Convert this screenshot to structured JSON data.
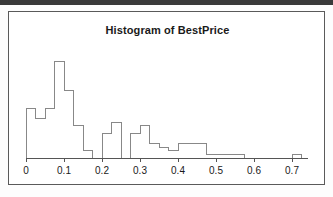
{
  "figure": {
    "title": "Histogram of BestPrice",
    "frame": {
      "stroke": "#5a5a5a",
      "background": "#ffffff"
    }
  },
  "chart_data": {
    "type": "bar",
    "title": "Histogram of BestPrice",
    "xlabel": "",
    "ylabel": "",
    "grid": false,
    "legend": false,
    "binwidth": 0.025,
    "xlim": [
      0.0,
      0.725
    ],
    "ylim": [
      0,
      30
    ],
    "xticks": [
      0,
      0.1,
      0.2,
      0.3,
      0.4,
      0.5,
      0.6,
      0.7
    ],
    "xticklabels": [
      "0",
      "0.1",
      "0.2",
      "0.3",
      "0.4",
      "0.5",
      "0.6",
      "0.7"
    ],
    "bin_edges": [
      0.0,
      0.025,
      0.05,
      0.075,
      0.1,
      0.125,
      0.15,
      0.175,
      0.2,
      0.225,
      0.25,
      0.275,
      0.3,
      0.325,
      0.35,
      0.375,
      0.4,
      0.425,
      0.45,
      0.475,
      0.5,
      0.525,
      0.55,
      0.575,
      0.6,
      0.625,
      0.65,
      0.675,
      0.7,
      0.725
    ],
    "categories": [
      "0.000-0.025",
      "0.025-0.050",
      "0.050-0.075",
      "0.075-0.100",
      "0.100-0.125",
      "0.125-0.150",
      "0.150-0.175",
      "0.175-0.200",
      "0.200-0.225",
      "0.225-0.250",
      "0.250-0.275",
      "0.275-0.300",
      "0.300-0.325",
      "0.325-0.350",
      "0.350-0.375",
      "0.375-0.400",
      "0.400-0.425",
      "0.425-0.450",
      "0.450-0.475",
      "0.475-0.500",
      "0.500-0.525",
      "0.525-0.550",
      "0.550-0.575",
      "0.575-0.600",
      "0.600-0.625",
      "0.625-0.650",
      "0.650-0.675",
      "0.675-0.700",
      "0.700-0.725"
    ],
    "values": [
      14,
      11,
      14,
      27,
      19,
      9,
      2,
      0,
      7,
      10,
      0,
      7,
      9,
      4,
      3,
      2,
      4,
      4,
      4,
      1,
      1,
      1,
      1,
      0,
      0,
      0,
      0,
      0,
      1
    ],
    "bar_style": {
      "fill": "none",
      "stroke": "#888888",
      "stroke_width": 1
    }
  }
}
